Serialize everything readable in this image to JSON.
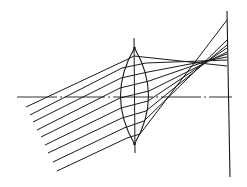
{
  "diagram": {
    "type": "optics-ray-diagram",
    "colors": {
      "background": "#ffffff",
      "line": "#1a1a1a",
      "axis": "#333333"
    },
    "optical_axis": {
      "x1": 17,
      "y1": 97,
      "x2": 232,
      "y2": 97
    },
    "lens": {
      "center_x": 134.5,
      "top_y": 48,
      "bottom_y": 144,
      "half_width": 14,
      "axis_line": {
        "x1": 134,
        "y1": 38,
        "x2": 135,
        "y2": 153
      }
    },
    "screen": {
      "x1": 227,
      "y1": 11,
      "x2": 230,
      "y2": 177
    },
    "rays": [
      {
        "points": [
          [
            26,
            107
          ],
          [
            126,
            60
          ],
          [
            134,
            56
          ],
          [
            227,
            66
          ]
        ]
      },
      {
        "points": [
          [
            30,
            115
          ],
          [
            122,
            68
          ],
          [
            146,
            63
          ],
          [
            227,
            60
          ]
        ]
      },
      {
        "points": [
          [
            33,
            122
          ],
          [
            121,
            78
          ],
          [
            148,
            72
          ],
          [
            227,
            57
          ]
        ]
      },
      {
        "points": [
          [
            37,
            130
          ],
          [
            120,
            88
          ],
          [
            149,
            81
          ],
          [
            227,
            54
          ]
        ]
      },
      {
        "points": [
          [
            41,
            137
          ],
          [
            120,
            98
          ],
          [
            149,
            91
          ],
          [
            227,
            52
          ]
        ]
      },
      {
        "points": [
          [
            45,
            145
          ],
          [
            121,
            108
          ],
          [
            148,
            101
          ],
          [
            227,
            48
          ]
        ]
      },
      {
        "points": [
          [
            48,
            153
          ],
          [
            122,
            118
          ],
          [
            146,
            111
          ],
          [
            227,
            45
          ]
        ]
      },
      {
        "points": [
          [
            53,
            162
          ],
          [
            124,
            128
          ],
          [
            144,
            121
          ],
          [
            227,
            40
          ]
        ]
      },
      {
        "points": [
          [
            57,
            171
          ],
          [
            127,
            138
          ],
          [
            140,
            134
          ],
          [
            227,
            20
          ]
        ]
      }
    ]
  }
}
